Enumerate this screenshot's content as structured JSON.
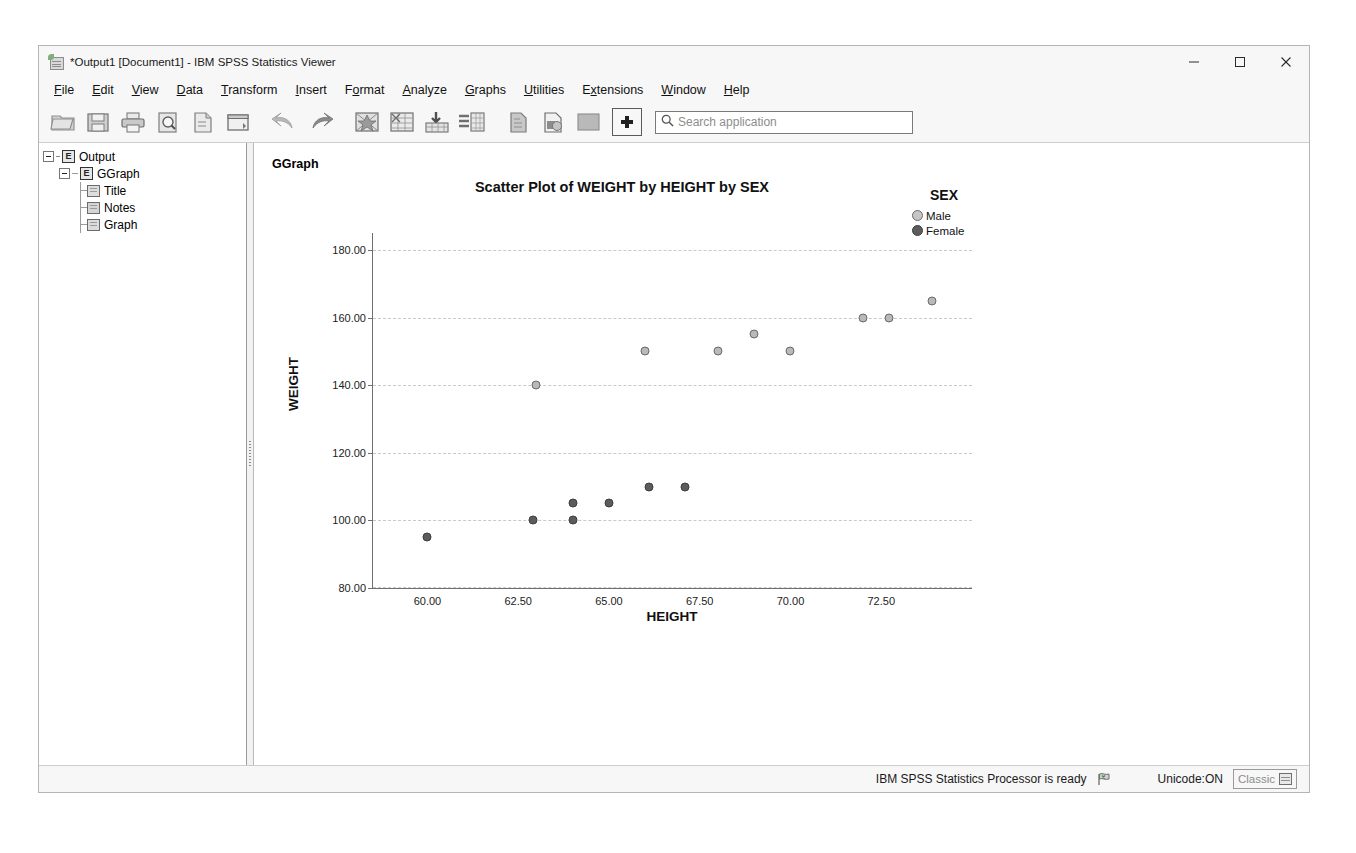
{
  "window": {
    "title": "*Output1 [Document1] - IBM SPSS Statistics Viewer",
    "icon": "spss-viewer-icon",
    "controls": {
      "minimize": "minimize-button",
      "maximize": "maximize-button",
      "close": "close-button"
    }
  },
  "menubar": {
    "items": [
      {
        "label": "File",
        "mnemonic": "F"
      },
      {
        "label": "Edit",
        "mnemonic": "E"
      },
      {
        "label": "View",
        "mnemonic": "V"
      },
      {
        "label": "Data",
        "mnemonic": "D"
      },
      {
        "label": "Transform",
        "mnemonic": "T"
      },
      {
        "label": "Insert",
        "mnemonic": "I"
      },
      {
        "label": "Format",
        "mnemonic": "o"
      },
      {
        "label": "Analyze",
        "mnemonic": "A"
      },
      {
        "label": "Graphs",
        "mnemonic": "G"
      },
      {
        "label": "Utilities",
        "mnemonic": "U"
      },
      {
        "label": "Extensions",
        "mnemonic": "x"
      },
      {
        "label": "Window",
        "mnemonic": "W"
      },
      {
        "label": "Help",
        "mnemonic": "H"
      }
    ]
  },
  "toolbar": {
    "buttons": [
      "open-file-icon",
      "save-icon",
      "print-icon",
      "print-preview-icon",
      "export-icon",
      "dialog-recall-icon",
      "undo-icon",
      "redo-icon",
      "goto-case-icon",
      "variables-icon",
      "insert-table-icon",
      "insert-text-icon",
      "show-hide-icon",
      "promote-icon",
      "demote-icon",
      "add-icon"
    ],
    "search": {
      "placeholder": "Search application",
      "value": "",
      "icon": "search-icon"
    }
  },
  "outline": {
    "nodes": [
      {
        "label": "Output",
        "icon": "output-document-icon",
        "level": 0
      },
      {
        "label": "GGraph",
        "icon": "ggraph-document-icon",
        "level": 1
      },
      {
        "label": "Title",
        "icon": "title-item-icon",
        "level": 2
      },
      {
        "label": "Notes",
        "icon": "notes-item-icon",
        "level": 2
      },
      {
        "label": "Graph",
        "icon": "graph-item-icon",
        "level": 2
      }
    ]
  },
  "content": {
    "heading": "GGraph"
  },
  "chart_data": {
    "type": "scatter",
    "title": "Scatter Plot of WEIGHT by HEIGHT by SEX",
    "xlabel": "HEIGHT",
    "ylabel": "WEIGHT",
    "xlim": [
      58.5,
      75.0
    ],
    "ylim": [
      80,
      185
    ],
    "xticks": [
      "60.00",
      "62.50",
      "65.00",
      "67.50",
      "70.00",
      "72.50"
    ],
    "xtick_values": [
      60.0,
      62.5,
      65.0,
      67.5,
      70.0,
      72.5
    ],
    "yticks": [
      "80.00",
      "100.00",
      "120.00",
      "140.00",
      "160.00",
      "180.00"
    ],
    "ytick_values": [
      80,
      100,
      120,
      140,
      160,
      180
    ],
    "grid": true,
    "grid_style": "dashed-horizontal",
    "legend": {
      "title": "SEX",
      "position": "top-right",
      "entries": [
        {
          "name": "Male",
          "color": "#c6c6c6",
          "marker": "circle"
        },
        {
          "name": "Female",
          "color": "#5c5c5c",
          "marker": "circle"
        }
      ]
    },
    "series": [
      {
        "name": "Male",
        "color": "#b9b9b9",
        "points": [
          {
            "x": 63.0,
            "y": 140
          },
          {
            "x": 66.0,
            "y": 150
          },
          {
            "x": 68.0,
            "y": 150
          },
          {
            "x": 69.0,
            "y": 155
          },
          {
            "x": 70.0,
            "y": 150
          },
          {
            "x": 72.0,
            "y": 160
          },
          {
            "x": 72.7,
            "y": 160
          },
          {
            "x": 73.9,
            "y": 165
          }
        ]
      },
      {
        "name": "Female",
        "color": "#5c5c5c",
        "points": [
          {
            "x": 60.0,
            "y": 95
          },
          {
            "x": 62.9,
            "y": 100
          },
          {
            "x": 64.0,
            "y": 100
          },
          {
            "x": 64.0,
            "y": 105
          },
          {
            "x": 65.0,
            "y": 105
          },
          {
            "x": 66.1,
            "y": 110
          },
          {
            "x": 67.1,
            "y": 110
          }
        ]
      }
    ]
  },
  "statusbar": {
    "message": "IBM SPSS Statistics Processor is ready",
    "ready_icon": "ready-flag-icon",
    "unicode": "Unicode:ON",
    "mode_label": "Classic",
    "mode_icon": "classic-grid-icon"
  }
}
